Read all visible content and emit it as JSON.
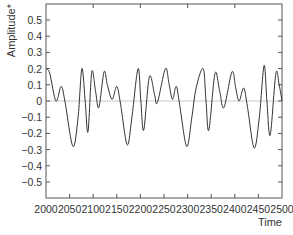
{
  "chart_data": {
    "type": "line",
    "title": "",
    "xlabel": "Time",
    "ylabel": "Amplitude*",
    "xlim": [
      2000,
      2500
    ],
    "ylim": [
      -0.6,
      0.6
    ],
    "grid": false,
    "legend": null,
    "x_ticks": [
      2000,
      2050,
      2100,
      2150,
      2200,
      2250,
      2300,
      2350,
      2400,
      2450,
      2500
    ],
    "x_tick_labels": [
      "2000",
      "2050",
      "2100",
      "2150",
      "2200",
      "2250",
      "2300",
      "2350",
      "2400",
      "2450",
      "2500"
    ],
    "y_ticks": [
      0.5,
      0.4,
      0.3,
      0.2,
      0.1,
      0,
      -0.1,
      -0.2,
      -0.3,
      -0.4,
      -0.5
    ],
    "y_tick_labels": [
      "0.5",
      "0.4",
      "0.3",
      "0.2",
      "0.1",
      "0",
      "−0.1",
      "−0.2",
      "−0.3",
      "−0.4",
      "−0.5"
    ],
    "reference_line": {
      "y": 0,
      "color": "#c8c8c8"
    },
    "series": [
      {
        "name": "Amplitude",
        "color": "#333333",
        "x": [
          2000,
          2008,
          2021,
          2032,
          2040,
          2057,
          2068,
          2076,
          2083,
          2089,
          2097,
          2105,
          2112,
          2123,
          2130,
          2140,
          2150,
          2158,
          2172,
          2182,
          2195,
          2201,
          2207,
          2219,
          2230,
          2236,
          2253,
          2261,
          2268,
          2276,
          2283,
          2298,
          2309,
          2318,
          2333,
          2339,
          2345,
          2358,
          2368,
          2377,
          2394,
          2402,
          2409,
          2419,
          2427,
          2441,
          2452,
          2462,
          2468,
          2475,
          2487,
          2494,
          2500
        ],
        "y": [
          0.2,
          0.17,
          0.0,
          0.09,
          0.0,
          -0.28,
          -0.1,
          0.2,
          0.0,
          -0.19,
          0.18,
          0.06,
          -0.04,
          0.18,
          0.1,
          0.01,
          0.09,
          -0.02,
          -0.27,
          -0.1,
          0.2,
          0.0,
          -0.18,
          0.15,
          0.04,
          -0.01,
          0.2,
          0.1,
          0.01,
          0.09,
          -0.02,
          -0.28,
          -0.1,
          0.08,
          0.2,
          0.0,
          -0.18,
          0.17,
          0.06,
          -0.04,
          0.18,
          0.08,
          0.0,
          0.08,
          -0.04,
          -0.29,
          -0.1,
          0.22,
          0.0,
          -0.21,
          0.17,
          0.1,
          0.0
        ]
      }
    ]
  }
}
